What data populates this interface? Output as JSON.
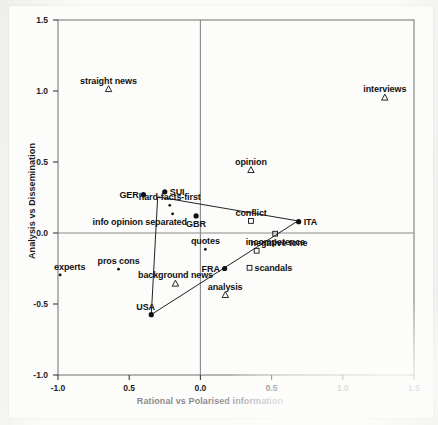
{
  "figure": {
    "background_color": "#fcfcfb",
    "ink_color": "#111111",
    "axis_color": "#6e6e6e"
  },
  "chart_data": {
    "type": "scatter",
    "title": "",
    "xlabel": "Rational vs Polarised information",
    "ylabel": "Analysis vs Dissemination",
    "xlim": [
      -1.0,
      1.5
    ],
    "ylim": [
      -1.0,
      1.5
    ],
    "xticks": [
      "-1.0",
      "0.5",
      "0.0",
      "0.5",
      "1.0",
      "1.5"
    ],
    "xtick_values": [
      -1.0,
      -0.5,
      0.0,
      0.5,
      1.0,
      1.5
    ],
    "yticks": [
      "1.5",
      "1.0",
      "0.5",
      "0.0",
      "-0.5",
      "-1.0"
    ],
    "ytick_values": [
      1.5,
      1.0,
      0.5,
      0.0,
      -0.5,
      -1.0
    ],
    "grid": false,
    "legend": "none",
    "reference_lines": {
      "x": 0.0,
      "y": 0.0
    },
    "marker_legend": [
      {
        "marker": "filled-circle",
        "meaning": "country"
      },
      {
        "marker": "triangle",
        "meaning": "content-format"
      },
      {
        "marker": "open-square",
        "meaning": "tone-topic"
      },
      {
        "marker": "small-dot",
        "meaning": "journalistic-role"
      }
    ],
    "series": [
      {
        "name": "countries",
        "marker": "filled-circle",
        "points": [
          {
            "label": "GER",
            "x": -0.4,
            "y": 0.27,
            "label_pos": "left"
          },
          {
            "label": "SUI",
            "x": -0.25,
            "y": 0.29,
            "label_pos": "right"
          },
          {
            "label": "GBR",
            "x": -0.03,
            "y": 0.12,
            "label_pos": "below"
          },
          {
            "label": "ITA",
            "x": 0.69,
            "y": 0.08,
            "label_pos": "right"
          },
          {
            "label": "FRA",
            "x": 0.17,
            "y": -0.25,
            "label_pos": "left"
          },
          {
            "label": "USA",
            "x": -0.345,
            "y": -0.575,
            "label_pos": "above-left"
          }
        ]
      },
      {
        "name": "formats",
        "marker": "triangle",
        "points": [
          {
            "label": "straight news",
            "x": -0.645,
            "y": 1.015,
            "label_pos": "above"
          },
          {
            "label": "interviews",
            "x": 1.295,
            "y": 0.955,
            "label_pos": "above"
          },
          {
            "label": "opinion",
            "x": 0.355,
            "y": 0.445,
            "label_pos": "above"
          },
          {
            "label": "background news",
            "x": -0.175,
            "y": -0.355,
            "label_pos": "above"
          },
          {
            "label": "analysis",
            "x": 0.175,
            "y": -0.435,
            "label_pos": "above"
          }
        ]
      },
      {
        "name": "topics",
        "marker": "open-square",
        "points": [
          {
            "label": "conflict",
            "x": 0.355,
            "y": 0.085,
            "label_pos": "above"
          },
          {
            "label": "incompetence",
            "x": 0.525,
            "y": -0.005,
            "label_pos": "below"
          },
          {
            "label": "negative tone",
            "x": 0.395,
            "y": -0.125,
            "label_pos": "above-right"
          },
          {
            "label": "scandals",
            "x": 0.345,
            "y": -0.245,
            "label_pos": "right"
          }
        ]
      },
      {
        "name": "roles",
        "marker": "small-dot",
        "points": [
          {
            "label": "hard-facts-first",
            "x": -0.215,
            "y": 0.195,
            "label_pos": "above"
          },
          {
            "label": "info opinion separated",
            "x": -0.195,
            "y": 0.135,
            "label_pos": "below-left"
          },
          {
            "label": "quotes",
            "x": 0.035,
            "y": -0.115,
            "label_pos": "above"
          },
          {
            "label": "pros cons",
            "x": -0.575,
            "y": -0.255,
            "label_pos": "above"
          },
          {
            "label": "experts",
            "x": -0.985,
            "y": -0.295,
            "label_pos": "above-right"
          }
        ]
      }
    ],
    "annotation_polygon": {
      "description": "triangle connecting SUI-region vertex, ITA and USA",
      "vertices": [
        {
          "x": -0.3,
          "y": 0.255
        },
        {
          "x": 0.685,
          "y": 0.085
        },
        {
          "x": -0.345,
          "y": -0.575
        }
      ]
    }
  }
}
